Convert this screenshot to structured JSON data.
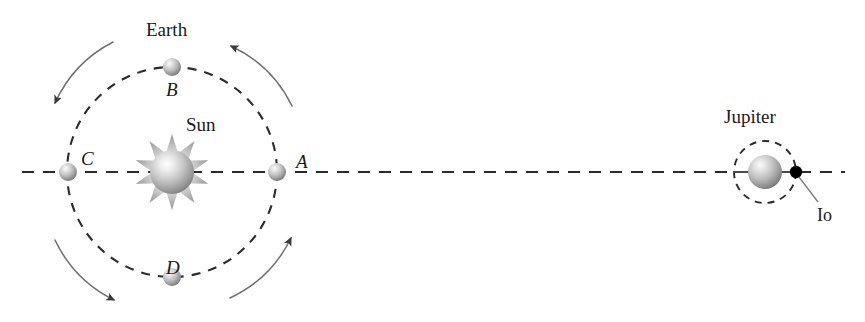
{
  "figure": {
    "background_color": "#ffffff",
    "width": 865,
    "height": 322
  },
  "colors": {
    "ink": "#1a1a1a",
    "dash": "#2b2b2b",
    "arrow": "#6b6b6b",
    "sphere_light": "#f2f2f2",
    "sphere_mid": "#b4b4b4",
    "sphere_dark": "#6a6a6a",
    "io": "#000000",
    "leader": "#7a7a7a"
  },
  "labels": {
    "sun": "Sun",
    "earth": "Earth",
    "jupiter": "Jupiter",
    "io": "Io",
    "position_a": "A",
    "position_b": "B",
    "position_c": "C",
    "position_d": "D"
  },
  "orbit": {
    "center_x": 172,
    "center_y": 172,
    "radius": 105,
    "direction": "counterclockwise",
    "style": "dashed"
  },
  "bodies": [
    {
      "name": "sun",
      "label": "Sun",
      "x": 172,
      "y": 172,
      "radius": 22,
      "kind": "star"
    },
    {
      "name": "earth-at-a",
      "label": "A",
      "x": 277,
      "y": 172,
      "radius": 9,
      "kind": "planet"
    },
    {
      "name": "earth-at-b",
      "label": "B",
      "x": 172,
      "y": 67,
      "radius": 9,
      "kind": "planet"
    },
    {
      "name": "earth-at-c",
      "label": "C",
      "x": 68,
      "y": 172,
      "radius": 9,
      "kind": "planet"
    },
    {
      "name": "earth-at-d",
      "label": "D",
      "x": 172,
      "y": 277,
      "radius": 9,
      "kind": "planet"
    },
    {
      "name": "jupiter",
      "label": "Jupiter",
      "x": 765,
      "y": 172,
      "radius": 17,
      "kind": "planet"
    },
    {
      "name": "io",
      "label": "Io",
      "x": 796,
      "y": 172,
      "radius": 6,
      "kind": "moon"
    }
  ],
  "jupiter_orbit": {
    "center_x": 765,
    "center_y": 172,
    "radius": 31,
    "style": "dashed"
  },
  "axis": {
    "y": 172,
    "x_start": 22,
    "x_end": 845,
    "style": "dashed"
  },
  "direction_arrows": [
    {
      "name": "arrow-upper-left",
      "points_to": "down-left"
    },
    {
      "name": "arrow-upper-right",
      "points_to": "up-left"
    },
    {
      "name": "arrow-lower-left",
      "points_to": "down-right"
    },
    {
      "name": "arrow-lower-right",
      "points_to": "up-right"
    }
  ],
  "label_positions": {
    "sun": {
      "x": 186,
      "y": 115
    },
    "earth": {
      "x": 146,
      "y": 20
    },
    "position_b": {
      "x": 166,
      "y": 80
    },
    "position_a": {
      "x": 296,
      "y": 152
    },
    "position_c": {
      "x": 81,
      "y": 149
    },
    "position_d": {
      "x": 166,
      "y": 258
    },
    "jupiter": {
      "x": 724,
      "y": 107
    },
    "io": {
      "x": 817,
      "y": 206
    }
  }
}
